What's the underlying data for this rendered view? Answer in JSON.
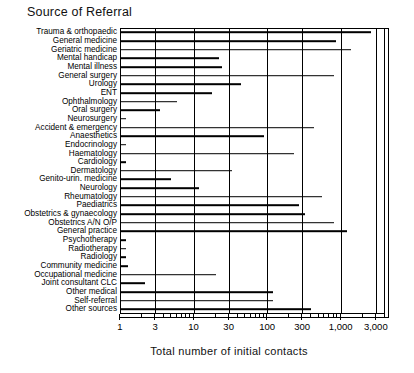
{
  "chart_data": {
    "type": "bar",
    "orientation": "horizontal",
    "title": "Source of Referral",
    "xlabel": "Total number of initial contacts",
    "ylabel": "",
    "xscale": "log",
    "xlim": [
      1,
      4000
    ],
    "grid": true,
    "legend": false,
    "xticks": [
      1,
      3,
      10,
      30,
      100,
      300,
      1000,
      3000
    ],
    "xtick_labels": [
      "1",
      "3",
      "10",
      "30",
      "100",
      "300",
      "1,000",
      "3,000"
    ],
    "categories": [
      "Trauma & orthopaedic",
      "General medicine",
      "Geriatric medicine",
      "Mental handicap",
      "Mental illness",
      "General surgery",
      "Urology",
      "ENT",
      "Ophthalmology",
      "Oral surgery",
      "Neurosurgery",
      "Accident & emergency",
      "Anaesthetics",
      "Endocrinology",
      "Haematology",
      "Cardiology",
      "Dermatology",
      "Genito-urin. medicine",
      "Neurology",
      "Rheumatology",
      "Paediatrics",
      "Obstetrics & gynaecology",
      "Obstetrics A/N O/P",
      "General practice",
      "Psychotherapy",
      "Radiotherapy",
      "Radiology",
      "Community medicine",
      "Occupational medicine",
      "Joint consultant CLC",
      "Other medical",
      "Self-referral",
      "Other sources"
    ],
    "values": [
      2600,
      850,
      1400,
      22,
      24,
      820,
      44,
      18,
      6,
      3.5,
      1.2,
      430,
      90,
      1.2,
      230,
      1.2,
      33,
      5,
      12,
      560,
      270,
      330,
      800,
      1200,
      1.2,
      1.2,
      1.2,
      1.3,
      20,
      2.2,
      120,
      120,
      390
    ]
  }
}
